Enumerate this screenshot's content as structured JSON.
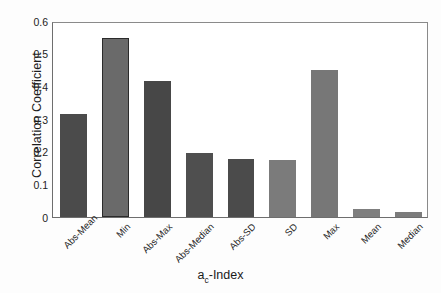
{
  "chart_data": {
    "type": "bar",
    "title": "",
    "xlabel": "aᴄ-Index",
    "xlabel_main": "a",
    "xlabel_sub": "c",
    "xlabel_rest": "-Index",
    "ylabel": "Correlation Coefficient",
    "categories": [
      "Abs-Mean",
      "Min",
      "Abs-Max",
      "Abs-Median",
      "Abs-SD",
      "SD",
      "Max",
      "Mean",
      "Median"
    ],
    "values": [
      0.32,
      0.553,
      0.42,
      0.198,
      0.178,
      0.177,
      0.456,
      0.025,
      0.015
    ],
    "ylim": [
      0,
      0.6
    ],
    "yticks": [
      0,
      0.1,
      0.2,
      0.3,
      0.4,
      0.5,
      0.6
    ],
    "ytick_labels": [
      "0",
      "0.1",
      "0.2",
      "0.3",
      "0.4",
      "0.5",
      "0.6"
    ],
    "grid": false,
    "legend": "none",
    "bar_colors": [
      "#4b4b4b",
      "#6a6a6a",
      "#474747",
      "#4f4f4f",
      "#4b4b4b",
      "#7b7b7b",
      "#777777",
      "#7f7f7f",
      "#7c7c7c"
    ],
    "bar_edge_colors": [
      "#4b4b4b",
      "#2b2b2b",
      "#474747",
      "#4f4f4f",
      "#4b4b4b",
      "#7b7b7b",
      "#777777",
      "#7f7f7f",
      "#7c7c7c"
    ],
    "axis_color": "#6e6e6e",
    "background_color": "#ffffff"
  }
}
